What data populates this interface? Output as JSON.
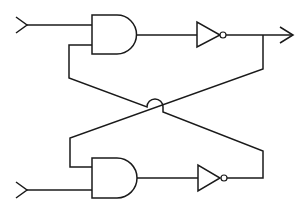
{
  "diagram": {
    "type": "logic-circuit",
    "colors": {
      "stroke": "#1a1a1a",
      "background": "#ffffff"
    },
    "components": [
      {
        "id": "input-top",
        "kind": "input-terminal",
        "icon": "chevron-left-arrow"
      },
      {
        "id": "and-top",
        "kind": "and-gate"
      },
      {
        "id": "not-top",
        "kind": "not-gate"
      },
      {
        "id": "output-top",
        "kind": "output-terminal",
        "icon": "arrow-right"
      },
      {
        "id": "input-bottom",
        "kind": "input-terminal",
        "icon": "chevron-left-arrow"
      },
      {
        "id": "and-bottom",
        "kind": "and-gate"
      },
      {
        "id": "not-bottom",
        "kind": "not-gate"
      }
    ],
    "connections": [
      {
        "from": "input-top",
        "to": "and-top.in1"
      },
      {
        "from": "and-top.out",
        "to": "not-top.in"
      },
      {
        "from": "not-top.out",
        "to": "output-top"
      },
      {
        "from": "not-top.out",
        "to": "and-bottom.in1",
        "note": "feedback, crosses diagonally"
      },
      {
        "from": "input-bottom",
        "to": "and-bottom.in2"
      },
      {
        "from": "and-bottom.out",
        "to": "not-bottom.in"
      },
      {
        "from": "not-bottom.out",
        "to": "and-top.in2",
        "note": "feedback, crosses diagonally with wire hop"
      }
    ],
    "labels": []
  }
}
